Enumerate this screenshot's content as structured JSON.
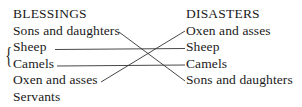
{
  "left_column": {
    "title": "BLESSINGS",
    "items": [
      "Sons and daughters",
      "Sheep",
      "Camels",
      "Oxen and asses",
      "Servants"
    ],
    "brace": "{"
  },
  "right_column": {
    "title": "DISASTERS",
    "items": [
      "Oxen and asses",
      "Sheep",
      "Camels",
      "Sons and daughters"
    ]
  },
  "connections": [
    {
      "from": "Sons and daughters",
      "to": "Sons and daughters"
    },
    {
      "from": "Sheep",
      "to": "Sheep"
    },
    {
      "from": "Camels",
      "to": "Camels"
    },
    {
      "from": "Oxen and asses",
      "to": "Oxen and asses"
    }
  ],
  "line_color": "#333333"
}
